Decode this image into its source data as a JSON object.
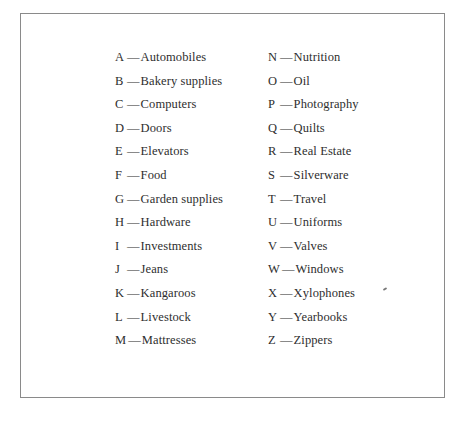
{
  "document": {
    "separator": "—",
    "left_column": [
      {
        "letter": "A",
        "term": "Automobiles"
      },
      {
        "letter": "B",
        "term": "Bakery supplies"
      },
      {
        "letter": "C",
        "term": "Computers"
      },
      {
        "letter": "D",
        "term": "Doors"
      },
      {
        "letter": "E",
        "term": "Elevators"
      },
      {
        "letter": "F",
        "term": "Food"
      },
      {
        "letter": "G",
        "term": "Garden supplies"
      },
      {
        "letter": "H",
        "term": "Hardware"
      },
      {
        "letter": "I",
        "term": "Investments"
      },
      {
        "letter": "J",
        "term": "Jeans"
      },
      {
        "letter": "K",
        "term": "Kangaroos"
      },
      {
        "letter": "L",
        "term": "Livestock"
      },
      {
        "letter": "M",
        "term": "Mattresses"
      }
    ],
    "right_column": [
      {
        "letter": "N",
        "term": "Nutrition"
      },
      {
        "letter": "O",
        "term": "Oil"
      },
      {
        "letter": "P",
        "term": "Photography"
      },
      {
        "letter": "Q",
        "term": "Quilts"
      },
      {
        "letter": "R",
        "term": "Real Estate"
      },
      {
        "letter": "S",
        "term": "Silverware"
      },
      {
        "letter": "T",
        "term": "Travel"
      },
      {
        "letter": "U",
        "term": "Uniforms"
      },
      {
        "letter": "V",
        "term": "Valves"
      },
      {
        "letter": "W",
        "term": "Windows"
      },
      {
        "letter": "X",
        "term": "Xylophones"
      },
      {
        "letter": "Y",
        "term": "Yearbooks"
      },
      {
        "letter": "Z",
        "term": "Zippers"
      }
    ]
  }
}
